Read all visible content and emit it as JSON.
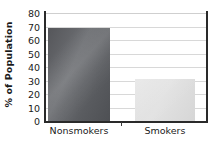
{
  "chart_data": {
    "type": "bar",
    "title": "",
    "subtitle": "",
    "xlabel": "",
    "ylabel": "% of Population",
    "categories": [
      "Nonsmokers",
      "Smokers"
    ],
    "values": [
      69,
      31
    ],
    "ylim": [
      0,
      80
    ],
    "ytick_labels": [
      "0",
      "10",
      "20",
      "30",
      "40",
      "50",
      "60",
      "70",
      "80"
    ],
    "ytick_values": [
      0,
      10,
      20,
      30,
      40,
      50,
      60,
      70,
      80
    ],
    "grid": "horizontal",
    "legend": "none",
    "annotations": [],
    "series": [
      {
        "name": "% of Population",
        "values": [
          69,
          31
        ],
        "colors": [
          "#5a5c60",
          "#dedede"
        ]
      }
    ]
  },
  "axes": {
    "y_title": "% of Population",
    "tick_color": "#1b1b1b",
    "axis_line_color": "#2a2a2a",
    "gridline_color": "#d8d8d8"
  },
  "bars": [
    {
      "label": "Nonsmokers",
      "value": 69,
      "fill": "#5a5c60",
      "style": "dark-gradient"
    },
    {
      "label": "Smokers",
      "value": 31,
      "fill": "#dedede",
      "style": "light-gradient"
    }
  ]
}
